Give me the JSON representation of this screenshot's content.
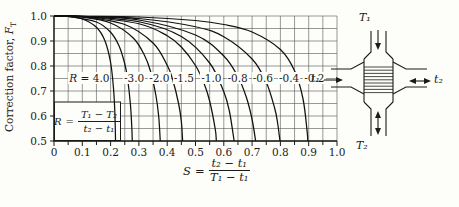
{
  "paper_color": "#fdfdfa",
  "ink_color": "#1b1b1b",
  "chart_data": {
    "type": "line",
    "ylabel": "Correction factor,",
    "ylabel_var": "F",
    "ylabel_sub": "T",
    "xlabel": "S = (t₂ − t₁)/(T₁ − t₁)",
    "xlabel_formula": {
      "lhs": "S",
      "eq": "=",
      "num": "t₂ − t₁",
      "den": "T₁ − t₁"
    },
    "r_definition": "R = (T₁ − T₂)/(t₂ − t₁)",
    "inset_formula": {
      "lhs": "R",
      "eq": "=",
      "num": "T₁ − T₂",
      "den": "t₂ − t₁"
    },
    "xlim": [
      0,
      1.0
    ],
    "ylim": [
      0.5,
      1.0
    ],
    "grid_step": 0.05,
    "x_ticks": [
      0,
      0.1,
      0.2,
      0.3,
      0.4,
      0.5,
      0.6,
      0.7,
      0.8,
      0.9,
      1.0
    ],
    "x_tick_labels": [
      "0",
      "0.1",
      "0.2",
      "0.3",
      "0.4",
      "0.5",
      "0.6",
      "0.7",
      "0.8",
      "0.9",
      "1.0"
    ],
    "y_ticks": [
      1.0,
      0.9,
      0.8,
      0.7,
      0.6,
      0.5
    ],
    "y_tick_labels": [
      "1.0",
      "0.9",
      "0.8",
      "0.7",
      "0.6",
      "0.5"
    ],
    "curve_label_row": {
      "f_level": 0.752,
      "labels": [
        {
          "var": "R",
          "text": " = 4.0",
          "s": 0.125
        },
        {
          "text": "-3.0",
          "s": 0.283
        },
        {
          "text": "-2.0",
          "s": 0.372
        },
        {
          "text": "-1.5",
          "s": 0.459
        },
        {
          "text": "-1.0",
          "s": 0.556
        },
        {
          "text": "-0.8",
          "s": 0.649
        },
        {
          "text": "-0.6",
          "s": 0.738
        },
        {
          "text": "-0.4",
          "s": 0.831
        },
        {
          "text": "-0.2",
          "s": 0.92
        }
      ]
    },
    "series": [
      {
        "name": "R = 4.0",
        "R": 4.0,
        "points": [
          [
            0,
            1.0
          ],
          [
            0.05,
            0.998
          ],
          [
            0.1,
            0.988
          ],
          [
            0.15,
            0.955
          ],
          [
            0.18,
            0.901
          ],
          [
            0.2,
            0.814
          ],
          [
            0.21,
            0.714
          ],
          [
            0.215,
            0.615
          ],
          [
            0.2175,
            0.5
          ]
        ]
      },
      {
        "name": "R = 3.0",
        "R": 3.0,
        "points": [
          [
            0,
            1.0
          ],
          [
            0.05,
            0.9985
          ],
          [
            0.15,
            0.976
          ],
          [
            0.2,
            0.935
          ],
          [
            0.23,
            0.88
          ],
          [
            0.25,
            0.809
          ],
          [
            0.26,
            0.749
          ],
          [
            0.27,
            0.647
          ],
          [
            0.275,
            0.553
          ],
          [
            0.2765,
            0.5
          ]
        ]
      },
      {
        "name": "R = 2.0",
        "R": 2.0,
        "points": [
          [
            0,
            1.0
          ],
          [
            0.1,
            0.995
          ],
          [
            0.2,
            0.972
          ],
          [
            0.28,
            0.912
          ],
          [
            0.32,
            0.842
          ],
          [
            0.34,
            0.783
          ],
          [
            0.36,
            0.683
          ],
          [
            0.37,
            0.598
          ],
          [
            0.3755,
            0.5
          ]
        ]
      },
      {
        "name": "R = 1.5",
        "R": 1.5,
        "points": [
          [
            0,
            1.0
          ],
          [
            0.1,
            0.997
          ],
          [
            0.25,
            0.966
          ],
          [
            0.35,
            0.892
          ],
          [
            0.4,
            0.803
          ],
          [
            0.42,
            0.743
          ],
          [
            0.44,
            0.651
          ],
          [
            0.45,
            0.579
          ],
          [
            0.4545,
            0.5
          ]
        ]
      },
      {
        "name": "R = 1.0",
        "R": 1.0,
        "points": [
          [
            0,
            1.0
          ],
          [
            0.1,
            0.998
          ],
          [
            0.3,
            0.969
          ],
          [
            0.4,
            0.921
          ],
          [
            0.45,
            0.876
          ],
          [
            0.5,
            0.802
          ],
          [
            0.53,
            0.731
          ],
          [
            0.55,
            0.66
          ],
          [
            0.57,
            0.546
          ],
          [
            0.5735,
            0.5
          ]
        ]
      },
      {
        "name": "R = 0.8",
        "R": 0.8,
        "points": [
          [
            0,
            1.0
          ],
          [
            0.1,
            0.998
          ],
          [
            0.3,
            0.977
          ],
          [
            0.45,
            0.918
          ],
          [
            0.55,
            0.812
          ],
          [
            0.6,
            0.697
          ],
          [
            0.62,
            0.618
          ],
          [
            0.6365,
            0.5
          ]
        ]
      },
      {
        "name": "R = 0.6",
        "R": 0.6,
        "points": [
          [
            0,
            1.0
          ],
          [
            0.1,
            0.999
          ],
          [
            0.3,
            0.984
          ],
          [
            0.5,
            0.924
          ],
          [
            0.6,
            0.84
          ],
          [
            0.65,
            0.757
          ],
          [
            0.68,
            0.674
          ],
          [
            0.7,
            0.586
          ],
          [
            0.7125,
            0.5
          ]
        ]
      },
      {
        "name": "R = 0.4",
        "R": 0.4,
        "points": [
          [
            0,
            1.0
          ],
          [
            0.1,
            0.999
          ],
          [
            0.3,
            0.99
          ],
          [
            0.5,
            0.957
          ],
          [
            0.6,
            0.917
          ],
          [
            0.7,
            0.828
          ],
          [
            0.75,
            0.735
          ],
          [
            0.78,
            0.63
          ],
          [
            0.79,
            0.573
          ],
          [
            0.7985,
            0.5
          ]
        ]
      },
      {
        "name": "R = 0.2",
        "R": 0.2,
        "points": [
          [
            0,
            1.0
          ],
          [
            0.1,
            0.999
          ],
          [
            0.3,
            0.996
          ],
          [
            0.5,
            0.982
          ],
          [
            0.6,
            0.966
          ],
          [
            0.7,
            0.936
          ],
          [
            0.8,
            0.866
          ],
          [
            0.85,
            0.781
          ],
          [
            0.88,
            0.668
          ],
          [
            0.895,
            0.532
          ],
          [
            0.8965,
            0.5
          ]
        ]
      }
    ]
  },
  "diagram": {
    "shell_inlet_label": "T₁",
    "shell_outlet_label": "T₂",
    "tube_inlet_label": "t₁",
    "tube_outlet_label": "t₂"
  }
}
